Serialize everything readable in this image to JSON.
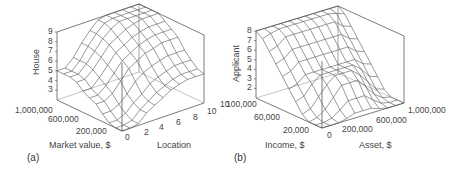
{
  "chart_data": [
    {
      "type": "surface",
      "panel_label": "(a)",
      "title": "",
      "zlabel": "House",
      "xlabel": "Market value, $",
      "ylabel": "Location",
      "z_ticks": [
        "3",
        "4",
        "5",
        "6",
        "7",
        "8",
        "9"
      ],
      "x_ticks": [
        "1,000,000",
        "600,000",
        "200,000"
      ],
      "y_ticks": [
        "0",
        "2",
        "4",
        "6",
        "8",
        "10"
      ],
      "extra_ticks": [
        "10"
      ],
      "zlim": [
        2,
        9
      ],
      "xlim": [
        0,
        1000000
      ],
      "ylim": [
        0,
        10
      ],
      "grid": false,
      "description": "Wireframe surface: house rating rises with market value and location; plateau near 9 at high values, ~5 at high market value / low location, ~2-3 at low values.",
      "x": [
        0,
        100000,
        200000,
        300000,
        400000,
        500000,
        600000,
        700000,
        800000,
        900000,
        1000000
      ],
      "y": [
        0,
        1,
        2,
        3,
        4,
        5,
        6,
        7,
        8,
        9,
        10
      ],
      "z": [
        [
          2,
          2,
          2.2,
          2.8,
          3.5,
          3.8,
          4.2,
          4.8,
          5,
          5,
          5
        ],
        [
          2,
          2,
          2.2,
          2.8,
          3.5,
          3.8,
          4.2,
          4.8,
          5,
          5,
          5
        ],
        [
          2.2,
          2.2,
          2.6,
          3.2,
          4,
          4.5,
          5,
          5.5,
          5.8,
          5.8,
          5.8
        ],
        [
          3,
          3,
          3.4,
          4,
          5,
          5.5,
          6,
          6.5,
          6.8,
          7,
          7
        ],
        [
          3.5,
          3.6,
          4,
          5,
          6,
          6.5,
          7,
          7.5,
          7.8,
          8,
          8
        ],
        [
          4,
          4.2,
          4.8,
          5.6,
          6.5,
          7,
          7.5,
          8,
          8.5,
          8.8,
          8.8
        ],
        [
          4.5,
          4.6,
          5.2,
          6,
          7,
          7.5,
          8,
          8.5,
          9,
          9,
          9
        ],
        [
          4.8,
          5,
          5.5,
          6.3,
          7.2,
          7.8,
          8.3,
          8.8,
          9,
          9,
          9
        ],
        [
          5,
          5.2,
          5.8,
          6.5,
          7.5,
          8,
          8.5,
          9,
          9,
          9,
          9
        ],
        [
          5,
          5.2,
          5.8,
          6.5,
          7.5,
          8,
          8.5,
          9,
          9,
          9,
          9
        ],
        [
          5,
          5.2,
          5.8,
          6.5,
          7.5,
          8,
          8.5,
          9,
          9,
          9,
          9
        ]
      ]
    },
    {
      "type": "surface",
      "panel_label": "(b)",
      "title": "",
      "zlabel": "Applicant",
      "xlabel": "Income, $",
      "ylabel": "Asset, $",
      "z_ticks": [
        "2",
        "3",
        "4",
        "5",
        "6",
        "7",
        "8"
      ],
      "x_ticks": [
        "100,000",
        "60,000",
        "20,000"
      ],
      "y_ticks": [
        "0",
        "200,000",
        "600,000",
        "1,000,000"
      ],
      "zlim": [
        1,
        8
      ],
      "xlim": [
        0,
        100000
      ],
      "ylim": [
        0,
        1000000
      ],
      "grid": false,
      "description": "Wireframe surface: applicant rating low (~1-2) at low income; rises to ~4-5 at moderate income, plateau near 8 at high income with high assets.",
      "x": [
        0,
        10000,
        20000,
        30000,
        40000,
        50000,
        60000,
        70000,
        80000,
        90000,
        100000
      ],
      "y": [
        0,
        100000,
        200000,
        300000,
        400000,
        500000,
        600000,
        700000,
        800000,
        900000,
        1000000
      ],
      "z": [
        [
          1,
          1,
          1,
          1.5,
          2.5,
          3.5,
          4.5,
          5.5,
          6.5,
          7.5,
          8
        ],
        [
          1,
          1,
          1.2,
          1.8,
          2.8,
          3.8,
          4.8,
          5.8,
          6.8,
          7.8,
          8
        ],
        [
          1,
          1.2,
          1.8,
          2.8,
          3.8,
          4.5,
          5.5,
          6.5,
          7.5,
          8,
          8
        ],
        [
          1.2,
          1.8,
          2.8,
          3.8,
          4.5,
          4.5,
          5.5,
          6.5,
          7.5,
          8,
          8
        ],
        [
          1.5,
          2.5,
          3.8,
          4.5,
          4.5,
          4.5,
          5.5,
          6.5,
          7.5,
          8,
          8
        ],
        [
          1.5,
          2.5,
          3.8,
          4.5,
          4.5,
          4.5,
          5.5,
          6.5,
          7.5,
          8,
          8
        ],
        [
          1.5,
          2.5,
          3.8,
          4.5,
          4.5,
          4.5,
          5.5,
          6.5,
          7.5,
          8,
          8
        ],
        [
          1.2,
          1.8,
          2.8,
          3.8,
          4.5,
          4.5,
          5.5,
          6.5,
          7.5,
          8,
          8
        ],
        [
          1,
          1.2,
          1.8,
          2.8,
          3.8,
          4.5,
          5.5,
          6.5,
          7.5,
          8,
          8
        ],
        [
          1,
          1,
          1.2,
          1.8,
          2.8,
          3.8,
          4.8,
          5.8,
          6.8,
          7.8,
          8
        ],
        [
          1,
          1,
          1,
          1.5,
          2.5,
          3.5,
          4.5,
          5.5,
          6.5,
          7.5,
          8
        ]
      ]
    }
  ]
}
